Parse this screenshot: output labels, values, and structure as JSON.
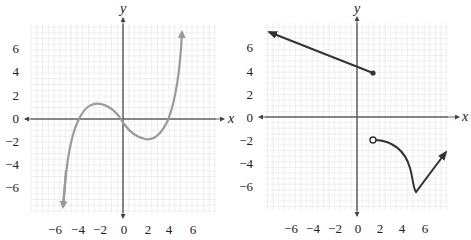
{
  "chart_data": [
    {
      "type": "line",
      "title": "",
      "xlabel": "x",
      "ylabel": "y",
      "xlim": [
        -8,
        8
      ],
      "ylim": [
        -8,
        8
      ],
      "grid": true,
      "x_ticks": [
        "-6",
        "-4",
        "-2",
        "0",
        "2",
        "4",
        "6"
      ],
      "y_ticks": [
        "6",
        "4",
        "2",
        "0",
        "-2",
        "-4",
        "-6"
      ],
      "curve_color": "#9a9a9a",
      "series": [
        {
          "name": "cubic curve",
          "description": "continuous cubic-like curve with arrows at both ends",
          "x": [
            -5.4,
            -4.6,
            -4.0,
            -3.0,
            -2.0,
            -1.0,
            0.0,
            1.0,
            2.0,
            3.0,
            4.0,
            4.6,
            5.2
          ],
          "y": [
            -8.0,
            -3.5,
            0.0,
            1.2,
            0.9,
            0.1,
            -0.6,
            -1.3,
            -1.7,
            -1.3,
            0.0,
            3.0,
            8.0
          ]
        }
      ],
      "features": {
        "local_max": [
          -3,
          1.2
        ],
        "local_min": [
          2,
          -1.7
        ],
        "x_intercepts": [
          -4,
          -0.5,
          4
        ],
        "end_behavior": "down-left arrow, up-right arrow"
      }
    },
    {
      "type": "line",
      "title": "",
      "xlabel": "x",
      "ylabel": "y",
      "xlim": [
        -8,
        8
      ],
      "ylim": [
        -8,
        8
      ],
      "grid": true,
      "x_ticks": [
        "-6",
        "-4",
        "-2",
        "0",
        "2",
        "4",
        "6"
      ],
      "y_ticks": [
        "6",
        "4",
        "2",
        "0",
        "-2",
        "-4",
        "-6"
      ],
      "curve_color": "#333333",
      "series": [
        {
          "name": "linear piece",
          "description": "ray from filled dot extending up-left with arrow",
          "x": [
            -8.0,
            1.5
          ],
          "y": [
            7.6,
            4.0
          ],
          "endpoint": {
            "x": 1.5,
            "y": 4,
            "style": "closed"
          }
        },
        {
          "name": "curved piece",
          "description": "starts at open circle, curves down to minimum, then rises as ray with arrow",
          "x": [
            1.5,
            3.0,
            4.0,
            4.8,
            5.3,
            6.5,
            8.2
          ],
          "y": [
            -2.0,
            -2.5,
            -3.4,
            -5.0,
            -6.7,
            -5.0,
            -3.0
          ],
          "endpoint": {
            "x": 1.5,
            "y": -2,
            "style": "open"
          }
        }
      ]
    }
  ]
}
